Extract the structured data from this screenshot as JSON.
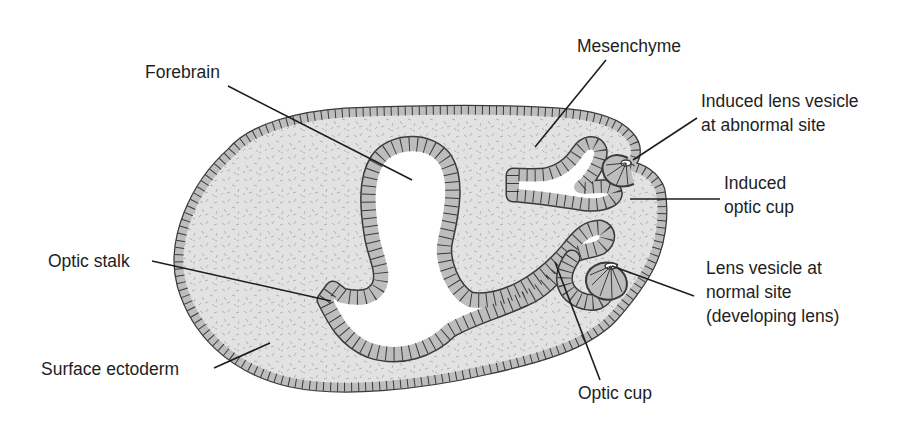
{
  "figure": {
    "type": "labeled anatomical cross-section",
    "colors": {
      "background": "#ffffff",
      "mesenchyme_fill": "#e2e2e2",
      "mesenchyme_speckle": "#b8b8b8",
      "epithelium_fill": "#bdbdbd",
      "outline": "#3a3a3a",
      "leader_line": "#1e1e1e",
      "label_text": "#1e1e1e"
    }
  },
  "labels": {
    "forebrain": {
      "lines": [
        "Forebrain"
      ]
    },
    "mesenchyme": {
      "lines": [
        "Mesenchyme"
      ]
    },
    "induced_lens_vesicle": {
      "lines": [
        "Induced lens vesicle",
        "at abnormal site"
      ]
    },
    "induced_optic_cup": {
      "lines": [
        "Induced",
        "optic cup"
      ]
    },
    "optic_stalk": {
      "lines": [
        "Optic stalk"
      ]
    },
    "lens_vesicle_normal": {
      "lines": [
        "Lens vesicle at",
        "normal site",
        "(developing lens)"
      ]
    },
    "surface_ectoderm": {
      "lines": [
        "Surface ectoderm"
      ]
    },
    "optic_cup": {
      "lines": [
        "Optic cup"
      ]
    }
  }
}
